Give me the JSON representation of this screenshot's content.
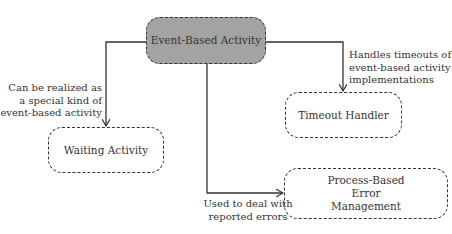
{
  "diagram": {
    "nodes": {
      "event_based_activity": {
        "label": "Event-Based Activity",
        "fill": "#a3a3a3"
      },
      "waiting_activity": {
        "label": "Waiting Activity"
      },
      "timeout_handler": {
        "label": "Timeout Handler"
      },
      "process_based_error": {
        "label": "Process-Based Error Management"
      }
    },
    "edges": {
      "to_waiting": {
        "label_lines": [
          "Can be realized as",
          "a special kind of",
          "event-based activity"
        ]
      },
      "to_timeout": {
        "label_lines": [
          "Handles timeouts of",
          "event-based activity",
          "implementations"
        ]
      },
      "to_error": {
        "label_lines": [
          "Used to deal with",
          "reported errors"
        ]
      }
    },
    "colors": {
      "line": "#333333",
      "primary_fill": "#a3a3a3",
      "background": "#ffffff"
    }
  }
}
